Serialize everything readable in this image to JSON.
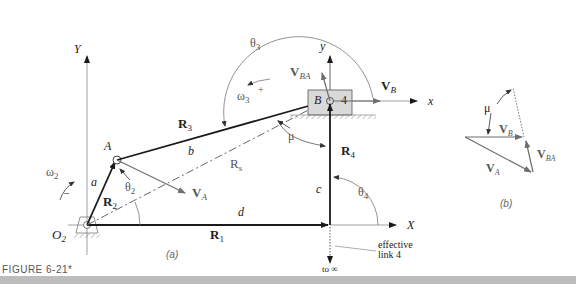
{
  "figure": {
    "caption": "FIGURE 6-21*",
    "part_a_label": "(a)",
    "part_b_label": "(b)"
  },
  "axes": {
    "global_x": "X",
    "global_y": "Y",
    "local_x": "x",
    "local_y": "y"
  },
  "points": {
    "O2": "O",
    "O2_sub": "2",
    "A": "A",
    "B": "B",
    "block_number": "4"
  },
  "links": {
    "a": "a",
    "b": "b",
    "c": "c",
    "d": "d"
  },
  "vectors": {
    "R1": "R",
    "R1_sub": "1",
    "R2": "R",
    "R2_sub": "2",
    "R3": "R",
    "R3_sub": "3",
    "R4": "R",
    "R4_sub": "4",
    "Rs": "R",
    "Rs_sub": "s",
    "VA": "V",
    "VA_sub": "A",
    "VB": "V",
    "VB_sub": "B",
    "VBA": "V",
    "VBA_sub": "BA"
  },
  "angles": {
    "theta2": "θ",
    "theta2_sub": "2",
    "theta3": "θ",
    "theta3_sub": "3",
    "theta4": "θ",
    "theta4_sub": "4",
    "mu": "μ",
    "omega2": "ω",
    "omega2_sub": "2",
    "omega2_sign": "–",
    "omega3": "ω",
    "omega3_sub": "3",
    "omega3_sign": "+"
  },
  "annotations": {
    "effective_line1": "effective",
    "effective_line2": "link 4",
    "to_infinity": "to ∞"
  },
  "colors": {
    "link": "#1a1a1a",
    "vector_gray": "#6e6e6e",
    "block_fill": "#d9d9d9",
    "caption_bar": "#bdbdbd"
  }
}
